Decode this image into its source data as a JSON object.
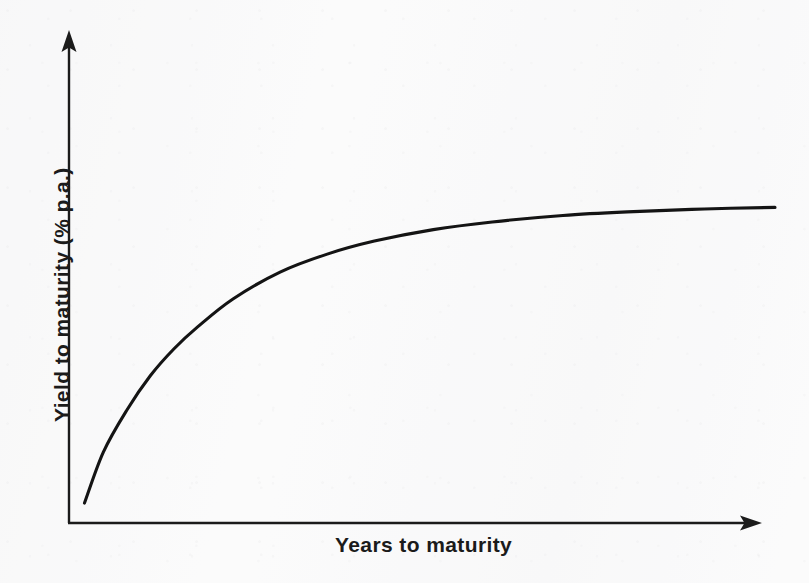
{
  "figure": {
    "background_color": "#fbfbfb",
    "ink_color": "#1b1b1b",
    "width": 809,
    "height": 583
  },
  "axes": {
    "x_axis_name": "x-axis-arrow-line",
    "y_axis_name": "y-axis-arrow-line",
    "x_label": "Years to maturity",
    "y_label": "Yield to maturity  (% p.a.)",
    "origin_px": [
      68,
      523
    ],
    "x_axis_end_px": [
      760,
      523
    ],
    "y_axis_end_px": [
      69,
      32
    ],
    "arrowheads": [
      "x-axis-arrowhead",
      "y-axis-arrowhead"
    ]
  },
  "chart_data": {
    "type": "line",
    "title": "",
    "xlabel": "Years to maturity",
    "ylabel": "Yield to maturity  (% p.a.)",
    "grid": false,
    "legend": false,
    "axis_ticks": false,
    "xlim": [
      0,
      30
    ],
    "ylim": [
      0,
      10
    ],
    "series": [
      {
        "name": "Normal (upward-sloping) yield curve",
        "x": [
          0.7,
          1.5,
          2.5,
          3.5,
          4.5,
          5.5,
          7.0,
          9.0,
          11.0,
          13.0,
          15.5,
          18.0,
          21.0,
          24.0,
          27.0,
          30.0
        ],
        "y": [
          0.52,
          1.85,
          2.95,
          3.85,
          4.55,
          5.12,
          5.85,
          6.55,
          7.02,
          7.36,
          7.66,
          7.86,
          8.03,
          8.13,
          8.2,
          8.24
        ]
      }
    ],
    "annotations": []
  }
}
